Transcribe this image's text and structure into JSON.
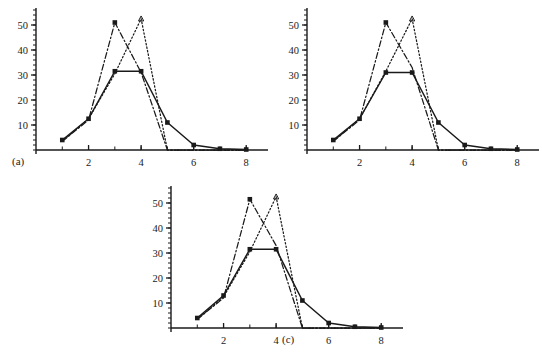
{
  "figure": {
    "background": "#ffffff",
    "ink": "#1a1a1a",
    "panel_count": 3
  },
  "chart_data": [
    {
      "type": "line",
      "panel": "a",
      "label": "(a)",
      "title": "",
      "xlabel": "",
      "ylabel": "",
      "xlim": [
        0,
        8.6
      ],
      "ylim": [
        0,
        56
      ],
      "xticks": [
        2,
        4,
        6,
        8
      ],
      "xtick_labels": [
        "2",
        "4",
        "6",
        "8"
      ],
      "xminor_ticks": [
        1,
        2,
        3,
        4,
        5,
        6,
        7,
        8
      ],
      "yticks": [
        10,
        20,
        30,
        40,
        50
      ],
      "ytick_labels": [
        "10",
        "20",
        "30",
        "40",
        "50"
      ],
      "yminor_step": 2,
      "grid": false,
      "legend": "none",
      "x": [
        1,
        2,
        3,
        4,
        5,
        6,
        7,
        8
      ],
      "series": [
        {
          "name": "dash-dot",
          "style": "dashdot",
          "marker": "square",
          "values": [
            3.5,
            12.0,
            51.0,
            31.0,
            0.0,
            0.0,
            0.0,
            0.0
          ]
        },
        {
          "name": "dotted",
          "style": "dotted",
          "marker": "triangle",
          "values": [
            3.5,
            12.5,
            30.5,
            52.5,
            0.0,
            0.0,
            0.0,
            0.0
          ]
        },
        {
          "name": "solid",
          "style": "solid",
          "marker": "square",
          "values": [
            4.0,
            12.5,
            31.5,
            31.5,
            11.0,
            2.0,
            0.5,
            0.2
          ]
        }
      ]
    },
    {
      "type": "line",
      "panel": "b",
      "label": "(b)",
      "title": "",
      "xlabel": "",
      "ylabel": "",
      "xlim": [
        0,
        8.6
      ],
      "ylim": [
        0,
        56
      ],
      "xticks": [
        2,
        4,
        6,
        8
      ],
      "xtick_labels": [
        "2",
        "4",
        "6",
        "8"
      ],
      "xminor_ticks": [
        1,
        2,
        3,
        4,
        5,
        6,
        7,
        8
      ],
      "yticks": [
        10,
        20,
        30,
        40,
        50
      ],
      "ytick_labels": [
        "10",
        "20",
        "30",
        "40",
        "50"
      ],
      "yminor_step": 2,
      "grid": false,
      "legend": "none",
      "x": [
        1,
        2,
        3,
        4,
        5,
        6,
        7,
        8
      ],
      "series": [
        {
          "name": "dash-dot",
          "style": "dashdot",
          "marker": "square",
          "values": [
            3.5,
            12.0,
            51.0,
            33.0,
            0.0,
            0.0,
            0.0,
            0.0
          ]
        },
        {
          "name": "dotted",
          "style": "dotted",
          "marker": "triangle",
          "values": [
            3.5,
            12.5,
            31.5,
            52.5,
            0.0,
            0.0,
            0.0,
            0.0
          ]
        },
        {
          "name": "solid",
          "style": "solid",
          "marker": "square",
          "values": [
            4.0,
            12.5,
            31.0,
            31.0,
            11.0,
            2.0,
            0.5,
            0.2
          ]
        }
      ]
    },
    {
      "type": "line",
      "panel": "c",
      "label": "(c)",
      "title": "",
      "xlabel": "",
      "ylabel": "",
      "xlim": [
        0,
        8.6
      ],
      "ylim": [
        0,
        56
      ],
      "xticks": [
        2,
        4,
        6,
        8
      ],
      "xtick_labels": [
        "2",
        "4",
        "6",
        "8"
      ],
      "xminor_ticks": [
        1,
        2,
        3,
        4,
        5,
        6,
        7,
        8
      ],
      "yticks": [
        10,
        20,
        30,
        40,
        50
      ],
      "ytick_labels": [
        "10",
        "20",
        "30",
        "40",
        "50"
      ],
      "yminor_step": 2,
      "grid": false,
      "legend": "none",
      "x": [
        1,
        2,
        3,
        4,
        5,
        6,
        7,
        8
      ],
      "series": [
        {
          "name": "dash-dot",
          "style": "dashdot",
          "marker": "square",
          "values": [
            3.5,
            12.0,
            51.5,
            33.0,
            0.0,
            0.0,
            0.0,
            0.0
          ]
        },
        {
          "name": "dotted",
          "style": "dotted",
          "marker": "triangle",
          "values": [
            3.5,
            12.5,
            30.5,
            52.5,
            0.0,
            0.0,
            0.0,
            0.0
          ]
        },
        {
          "name": "solid",
          "style": "solid",
          "marker": "square",
          "values": [
            4.0,
            13.0,
            31.5,
            31.5,
            11.0,
            2.0,
            0.5,
            0.2
          ]
        }
      ]
    }
  ]
}
